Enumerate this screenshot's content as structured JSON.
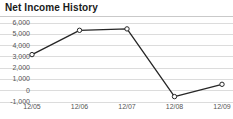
{
  "widget": {
    "title": "Net Income History",
    "accent_color": "#262626",
    "grid_color": "#dcdcdc",
    "axis_text_color": "#555555",
    "title_color": "#1a1a1a"
  },
  "chart_data": {
    "type": "line",
    "title": "Net Income History",
    "xlabel": "",
    "ylabel": "",
    "categories": [
      "12/05",
      "12/06",
      "12/07",
      "12/08",
      "12/09"
    ],
    "values": [
      3200,
      5350,
      5480,
      -520,
      570
    ],
    "series": [
      {
        "name": "Net Income",
        "values": [
          3200,
          5350,
          5480,
          -520,
          570
        ]
      }
    ],
    "ylim": [
      -1000,
      6000
    ],
    "yticks": [
      6000,
      5000,
      4000,
      3000,
      2000,
      1000,
      0,
      -1000
    ],
    "ytick_labels": [
      "6,000",
      "5,000",
      "4,000",
      "3,000",
      "2,000",
      "1,000",
      "0",
      "-1,000"
    ],
    "grid": true,
    "grid_axis": "y",
    "legend": false,
    "markers": "open-circle"
  }
}
